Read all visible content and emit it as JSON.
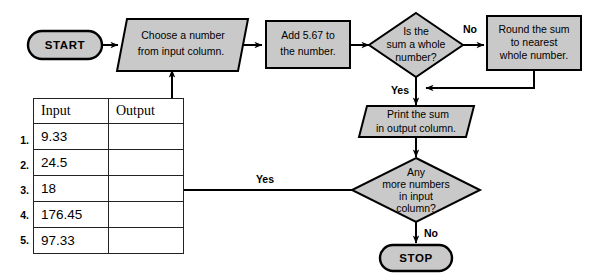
{
  "diagram": {
    "type": "flowchart",
    "fill_color": "#c9c9c9",
    "line_color": "#000000",
    "nodes": [
      {
        "id": "start",
        "shape": "terminal",
        "lines": [
          "START"
        ]
      },
      {
        "id": "choose",
        "shape": "parallelogram",
        "lines": [
          "Choose a number",
          "from input column."
        ]
      },
      {
        "id": "add",
        "shape": "rectangle",
        "lines": [
          "Add 5.67 to",
          "the number."
        ]
      },
      {
        "id": "is_whole",
        "shape": "diamond",
        "lines": [
          "Is the",
          "sum a whole",
          "number?"
        ]
      },
      {
        "id": "round",
        "shape": "rectangle",
        "lines": [
          "Round the sum",
          "to nearest",
          "whole number."
        ]
      },
      {
        "id": "print",
        "shape": "parallelogram",
        "lines": [
          "Print the sum",
          "in output column."
        ]
      },
      {
        "id": "any_more",
        "shape": "diamond",
        "lines": [
          "Any",
          "more numbers",
          "in input",
          "column?"
        ]
      },
      {
        "id": "stop",
        "shape": "terminal",
        "lines": [
          "STOP"
        ]
      }
    ],
    "edge_labels": {
      "is_whole_no": "No",
      "is_whole_yes": "Yes",
      "any_more_yes": "Yes",
      "any_more_no": "No"
    }
  },
  "table": {
    "headers": [
      "Input",
      "Output"
    ],
    "rows": [
      {
        "num": "1.",
        "input": "9.33",
        "output": ""
      },
      {
        "num": "2.",
        "input": "24.5",
        "output": ""
      },
      {
        "num": "3.",
        "input": "18",
        "output": ""
      },
      {
        "num": "4.",
        "input": "176.45",
        "output": ""
      },
      {
        "num": "5.",
        "input": "97.33",
        "output": ""
      }
    ]
  }
}
